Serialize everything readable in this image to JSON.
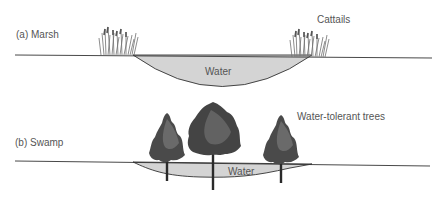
{
  "diagram": {
    "panels": [
      {
        "id": "a",
        "label": "(a) Marsh",
        "water_label": "Water",
        "vegetation_label": "Cattails"
      },
      {
        "id": "b",
        "label": "(b) Swamp",
        "water_label": "Water",
        "vegetation_label": "Water-tolerant trees"
      }
    ],
    "colors": {
      "water_fill": "#d4d4d4",
      "ground_line": "#333333",
      "label_text": "#555555",
      "vegetation_dark": "#3a3a3a",
      "vegetation_mid": "#6e6e6e"
    },
    "icons": [
      "cattail-cluster",
      "tree"
    ]
  }
}
